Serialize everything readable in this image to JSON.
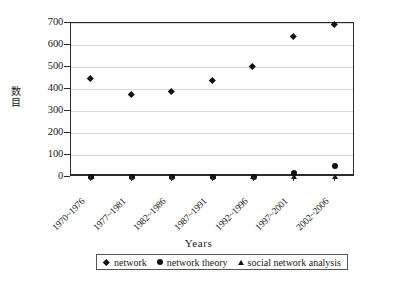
{
  "chart_data": {
    "type": "scatter",
    "title": "",
    "xlabel": "Years",
    "ylabel": "数目",
    "ylim": [
      0,
      700
    ],
    "yticks": [
      0,
      100,
      200,
      300,
      400,
      500,
      600,
      700
    ],
    "grid": true,
    "legend_position": "bottom",
    "categories": [
      "1970~1976",
      "1977~1981",
      "1982~1986",
      "1987~1991",
      "1992~1996",
      "1997~2001",
      "2002~2006"
    ],
    "series": [
      {
        "name": "network",
        "marker": "diamond",
        "color": "#111111",
        "values": [
          443,
          370,
          385,
          435,
          500,
          635,
          692
        ]
      },
      {
        "name": "network theory",
        "marker": "circle",
        "color": "#111111",
        "values": [
          2,
          2,
          1,
          1,
          2,
          18,
          48
        ]
      },
      {
        "name": "social network analysis",
        "marker": "triangle",
        "color": "#111111",
        "values": [
          0,
          0,
          0,
          0,
          0,
          0,
          0
        ]
      }
    ]
  },
  "axes": {
    "y_tick_labels": [
      "700",
      "600",
      "500",
      "400",
      "300",
      "200",
      "100",
      "0"
    ],
    "y_title": "数目",
    "x_title": "Years"
  },
  "legend": {
    "entries": [
      {
        "label": "network",
        "icon": "diamond-marker-icon"
      },
      {
        "label": "network theory",
        "icon": "circle-marker-icon"
      },
      {
        "label": "social network analysis",
        "icon": "triangle-marker-icon"
      }
    ]
  },
  "colors": {
    "marker": "#111111",
    "axis": "#2b2b2b",
    "grid": "#d8d8d8",
    "background": "#ffffff"
  }
}
